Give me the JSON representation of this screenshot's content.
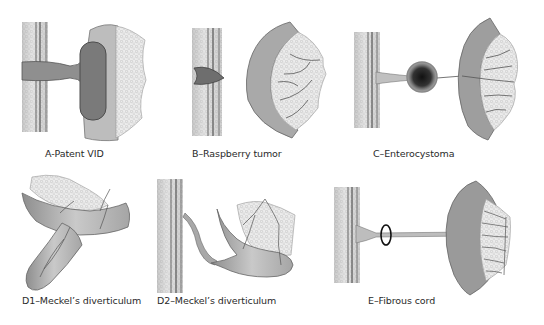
{
  "figure": {
    "panels": [
      {
        "id": "A",
        "caption": "A-Patent VID"
      },
      {
        "id": "B",
        "caption": "B–Raspberry tumor"
      },
      {
        "id": "C",
        "caption": "C–Enterocystoma"
      },
      {
        "id": "D1",
        "caption": "D1–Meckel’s diverticulum"
      },
      {
        "id": "D2",
        "caption": "D2–Meckel’s diverticulum"
      },
      {
        "id": "E",
        "caption": "E–Fibrous cord"
      }
    ]
  }
}
